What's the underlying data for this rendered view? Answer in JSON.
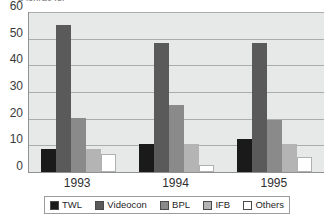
{
  "chart": {
    "clipped_title": "a lonrac fei",
    "background": "#e7e9e9",
    "axis_color": "#8f9193",
    "grid_color": "#a9adae"
  },
  "chart_data": {
    "type": "bar",
    "title": "",
    "xlabel": "",
    "ylabel": "",
    "categories": [
      "1993",
      "1994",
      "1995"
    ],
    "ylim": [
      0,
      60
    ],
    "yticks": [
      0,
      10,
      20,
      30,
      40,
      50,
      60
    ],
    "grid": true,
    "legend_position": "bottom",
    "series": [
      {
        "name": "TWL",
        "color": "#1a1a1a",
        "values": [
          8.7,
          10.5,
          12.5
        ]
      },
      {
        "name": "Videocon",
        "color": "#5a5a5a",
        "values": [
          55.0,
          48.5,
          48.5
        ]
      },
      {
        "name": "BPL",
        "color": "#8a8a8a",
        "values": [
          20.4,
          25.0,
          19.5
        ]
      },
      {
        "name": "IFB",
        "color": "#b4b4b4",
        "values": [
          8.7,
          10.5,
          10.5
        ]
      },
      {
        "name": "Others",
        "color": "#ffffff",
        "values": [
          6.8,
          2.6,
          5.7
        ]
      }
    ]
  },
  "y_axis": {
    "ticks": [
      {
        "label": "60"
      },
      {
        "label": "50"
      },
      {
        "label": "40"
      },
      {
        "label": "30"
      },
      {
        "label": "20"
      },
      {
        "label": "10"
      },
      {
        "label": "0"
      }
    ]
  },
  "x_axis": {
    "ticks": [
      {
        "label": "1993"
      },
      {
        "label": "1994"
      },
      {
        "label": "1995"
      }
    ]
  },
  "legend": {
    "items": [
      {
        "label": "TWL",
        "color": "#1a1a1a"
      },
      {
        "label": "Videocon",
        "color": "#5a5a5a"
      },
      {
        "label": "BPL",
        "color": "#8a8a8a"
      },
      {
        "label": "IFB",
        "color": "#b4b4b4"
      },
      {
        "label": "Others",
        "color": "#ffffff"
      }
    ]
  }
}
